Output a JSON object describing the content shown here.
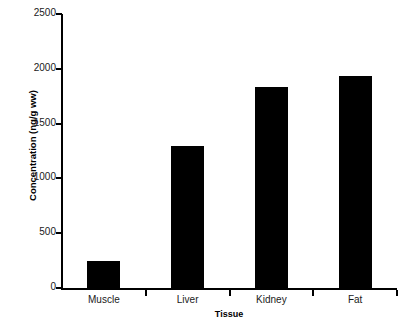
{
  "chart_data": {
    "type": "bar",
    "title": "",
    "subtitle": "",
    "xlabel": "Tissue",
    "ylabel": "Concentration (ng/g ww)",
    "categories": [
      "Muscle",
      "Liver",
      "Kidney",
      "Fat"
    ],
    "values": [
      250,
      1300,
      1830,
      1930
    ],
    "series": [
      {
        "name": "Concentration",
        "values": [
          250,
          1300,
          1830,
          1930
        ],
        "color": "#000000"
      }
    ],
    "ylim": [
      0,
      2500
    ],
    "ytick_values": [
      0,
      500,
      1000,
      1500,
      2000,
      2500
    ],
    "ytick_labels": [
      "0",
      "500",
      "1000",
      "1500",
      "2000",
      "2500"
    ],
    "grid": false,
    "legend": false,
    "legend_position": "none",
    "annotations": []
  },
  "style": {
    "bar_color": "#000000",
    "axis_color": "#000000",
    "text_color": "#1a1a1a",
    "background": "#ffffff"
  }
}
